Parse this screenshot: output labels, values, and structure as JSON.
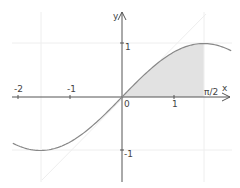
{
  "chart_data": {
    "type": "area",
    "title": "",
    "xlabel": "x",
    "ylabel": "y",
    "xlim": [
      -2.1,
      2.1
    ],
    "ylim": [
      -1.55,
      1.6
    ],
    "grid": true,
    "legend": "none",
    "series": [
      {
        "name": "sin(x)",
        "function": "sin",
        "x_range": [
          -2.1,
          2.1
        ],
        "color": "#888888"
      },
      {
        "name": "y = x",
        "function": "identity",
        "x_range": [
          -1.55,
          1.6
        ],
        "color": "#eeeeee"
      }
    ],
    "shaded_region": {
      "from": 0,
      "to": 1.5708,
      "under": "sin(x)",
      "color": "#e2e2e2"
    },
    "x_ticks": [
      {
        "value": -2,
        "label": "-2"
      },
      {
        "value": -1,
        "label": "-1"
      },
      {
        "value": 0,
        "label": "0"
      },
      {
        "value": 1,
        "label": "1"
      },
      {
        "value": 1.5708,
        "label": "π/2"
      }
    ],
    "y_ticks": [
      {
        "value": 1,
        "label": "1"
      },
      {
        "value": -1,
        "label": "-1"
      }
    ],
    "gridlines": {
      "x": [
        -1.5708,
        1.5708
      ],
      "y": [
        1,
        -1
      ]
    }
  },
  "labels": {
    "x_axis": "x",
    "y_axis": "y",
    "origin": "0",
    "x_m2": "-2",
    "x_m1": "-1",
    "x_1": "1",
    "x_pi2": "π/2",
    "y_1": "1",
    "y_m1": "-1"
  }
}
